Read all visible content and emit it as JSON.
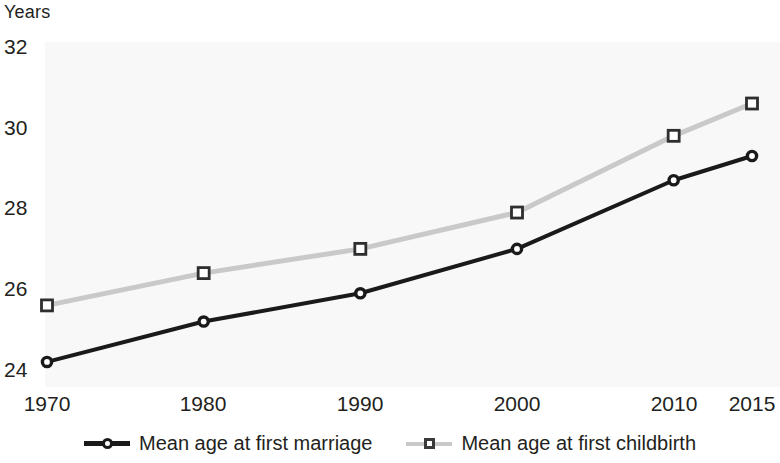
{
  "chart_data": {
    "type": "line",
    "title": "",
    "ylabel": "Years",
    "xlabel": "",
    "x": [
      1970,
      1980,
      1990,
      2000,
      2010,
      2015
    ],
    "categories": [
      "1970",
      "1980",
      "1990",
      "2000",
      "2010",
      "2015"
    ],
    "series": [
      {
        "name": "Mean age at first marriage",
        "values": [
          24.2,
          25.2,
          25.9,
          27.0,
          28.7,
          29.3
        ],
        "color": "#1a1a1a",
        "marker": "circle"
      },
      {
        "name": "Mean age at first childbirth",
        "values": [
          25.6,
          26.4,
          27.0,
          27.9,
          29.8,
          30.6
        ],
        "color": "#c9c9c9",
        "marker": "square"
      }
    ],
    "ylim": [
      23.4,
      32.4
    ],
    "xlim": [
      1970,
      2015
    ],
    "yticks": [
      24,
      26,
      28,
      30,
      32
    ],
    "ytick_labels": [
      "24",
      "26",
      "28",
      "30",
      "32"
    ],
    "xtick_labels": [
      "1970",
      "1980",
      "1990",
      "2000",
      "2010",
      "2015"
    ],
    "grid": false,
    "legend_position": "bottom"
  },
  "axis": {
    "y_title": "Years",
    "y_ticks": [
      {
        "label": "32",
        "value": 32
      },
      {
        "label": "30",
        "value": 30
      },
      {
        "label": "28",
        "value": 28
      },
      {
        "label": "26",
        "value": 26
      },
      {
        "label": "24",
        "value": 24
      }
    ],
    "x_ticks": [
      {
        "label": "1970",
        "value": 1970
      },
      {
        "label": "1980",
        "value": 1980
      },
      {
        "label": "1990",
        "value": 1990
      },
      {
        "label": "2000",
        "value": 2000
      },
      {
        "label": "2010",
        "value": 2010
      },
      {
        "label": "2015",
        "value": 2015
      }
    ]
  },
  "legend": {
    "items": [
      {
        "label": "Mean age at first marriage",
        "color": "#1a1a1a",
        "marker": "circle-marker-icon"
      },
      {
        "label": "Mean age at first childbirth",
        "color": "#c9c9c9",
        "marker": "square-marker-icon"
      }
    ]
  }
}
